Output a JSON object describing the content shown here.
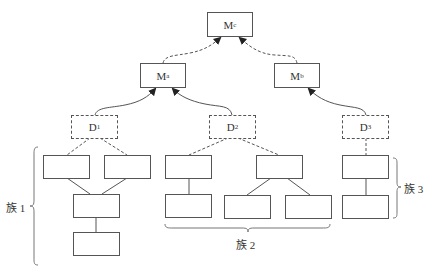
{
  "nodes": {
    "mc": {
      "base": "M",
      "sub": "c"
    },
    "ma": {
      "base": "M",
      "sub": "a"
    },
    "mb": {
      "base": "M",
      "sub": "b"
    },
    "d1": {
      "base": "D",
      "sub": "1"
    },
    "d2": {
      "base": "D",
      "sub": "2"
    },
    "d3": {
      "base": "D",
      "sub": "3"
    }
  },
  "families": [
    {
      "label": "族 1"
    },
    {
      "label": "族 2"
    },
    {
      "label": "族 3"
    }
  ],
  "colors": {
    "line": "#555555",
    "background": "#ffffff"
  }
}
